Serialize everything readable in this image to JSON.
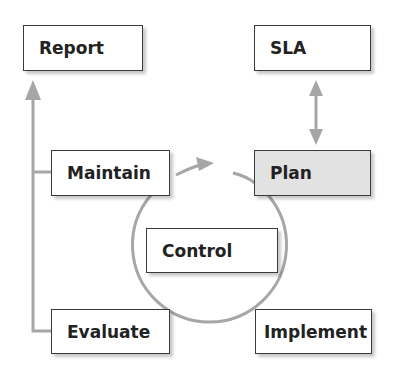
{
  "diagram": {
    "type": "process-cycle",
    "colors": {
      "connector": "#a6a6a6",
      "box_border": "#3a3a3a",
      "box_fill": "#ffffff",
      "highlight_fill": "#e2e2e2",
      "text": "#222222"
    },
    "nodes": {
      "report": {
        "label": "Report"
      },
      "sla": {
        "label": "SLA"
      },
      "maintain": {
        "label": "Maintain"
      },
      "plan": {
        "label": "Plan",
        "highlighted": true
      },
      "control": {
        "label": "Control"
      },
      "evaluate": {
        "label": "Evaluate"
      },
      "implement": {
        "label": "Implement"
      }
    },
    "edges": [
      {
        "from": "sla",
        "to": "plan",
        "type": "bidirectional-arrow"
      },
      {
        "from": "maintain",
        "to": "plan",
        "type": "cycle-arrow"
      },
      {
        "from": "plan",
        "to": "implement",
        "type": "cycle-arc"
      },
      {
        "from": "implement",
        "to": "evaluate",
        "type": "cycle-arc"
      },
      {
        "from": "evaluate",
        "to": "maintain",
        "type": "cycle-arc"
      },
      {
        "from": "evaluate",
        "to": "report",
        "type": "feedback-arrow"
      },
      {
        "from": "maintain",
        "to": "report",
        "type": "feedback-arrow"
      }
    ]
  }
}
